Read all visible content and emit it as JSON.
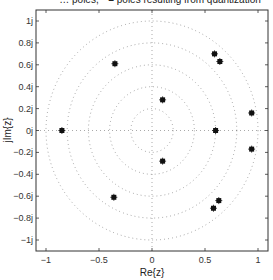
{
  "chart_data": {
    "type": "scatter",
    "title": "… poles, * = poles resulting from quantization",
    "title_clipped": true,
    "xlabel": "Re{z}",
    "ylabel": "jIm{z}",
    "xlim": [
      -1.1,
      1.1
    ],
    "ylim": [
      -1.1,
      1.1
    ],
    "x_ticks": [
      -1,
      -0.5,
      0,
      0.5,
      1
    ],
    "x_tick_labels": [
      "-1",
      "-0.5",
      "0",
      "0.5",
      "1"
    ],
    "y_ticks": [
      1,
      0.8,
      0.6,
      0.4,
      0.2,
      0,
      -0.2,
      -0.4,
      -0.6,
      -0.8,
      -1
    ],
    "y_tick_labels": [
      "1j",
      "0.8j",
      "0.6j",
      "0.4j",
      "0.2j",
      "0j",
      "-0.2j",
      "-0.4j",
      "-0.6j",
      "-0.8j",
      "-1j"
    ],
    "grid": "zplane-dotted",
    "grid_circles_radii": [
      0.2,
      0.4,
      0.6,
      0.8,
      1.0
    ],
    "marker": "*",
    "series": [
      {
        "name": "poles resulting from quantization",
        "points": [
          {
            "re": 0.1,
            "im": 0.28
          },
          {
            "re": 0.1,
            "im": -0.28
          },
          {
            "re": 0.59,
            "im": 0.7
          },
          {
            "re": 0.64,
            "im": 0.63
          },
          {
            "re": 0.94,
            "im": 0.16
          },
          {
            "re": 0.6,
            "im": 0.0
          },
          {
            "re": 0.94,
            "im": -0.17
          },
          {
            "re": 0.63,
            "im": -0.64
          },
          {
            "re": 0.58,
            "im": -0.71
          },
          {
            "re": -0.35,
            "im": 0.61
          },
          {
            "re": -0.36,
            "im": -0.61
          },
          {
            "re": -0.85,
            "im": 0.0
          }
        ]
      }
    ],
    "legend": "none"
  },
  "labels": {
    "title": "… poles, * = poles resulting from quantization",
    "xlabel": "Re{z}",
    "ylabel": "jIm{z}"
  }
}
